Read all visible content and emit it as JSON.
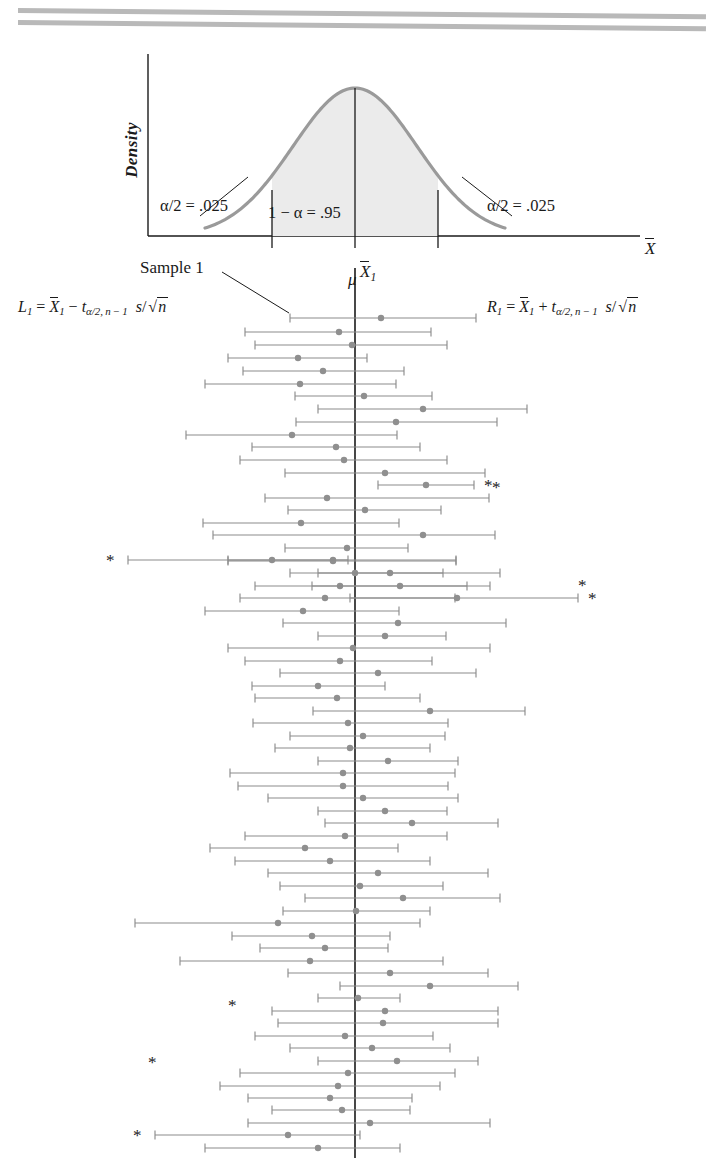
{
  "figure": {
    "top_rule_count": 2,
    "colors": {
      "curve": "#9a9a9a",
      "curve_fill": "#ebebeb",
      "interval_line": "#8c8c8c",
      "mean_dot": "#8f8f8f",
      "axis": "#1a1a1a",
      "mu_line": "#1a1a1a",
      "rule": "#b9b9b9"
    }
  },
  "density_panel": {
    "ylabel": "Density",
    "xlabel": "X̄",
    "center_label": "μ",
    "alpha_left_label": "α/2 = .025",
    "alpha_right_label": "α/2 = .025",
    "confidence_label": "1 − α = .95",
    "alpha_left_value": 0.025,
    "alpha_right_value": 0.025,
    "confidence_value": 0.95
  },
  "annotations": {
    "sample_label": "Sample 1",
    "xbar1_label": "X̄1",
    "formula_left": "L1 = X̄1 − tα/2, n−1 s/√n",
    "formula_right": "R1 = X̄1 + tα/2, n−1 s/√n",
    "miss_marker": "*"
  },
  "chart_data": {
    "type": "line",
    "xlabel": "X̄",
    "ylabel": "Sample",
    "mu": 355,
    "grid": false,
    "legend": null,
    "x_pixel_range": [
      18,
      700
    ],
    "note": "Each row is one sample's 95% CI: left endpoint L, sample mean (dot), right endpoint R, all in page x-pixels. covers=false rows are flagged with an asterisk.",
    "intervals": [
      {
        "y": 318,
        "left": 290,
        "mean": 381,
        "right": 476,
        "covers": true,
        "marker": null
      },
      {
        "y": 332,
        "left": 245,
        "mean": 339,
        "right": 431,
        "covers": true,
        "marker": null
      },
      {
        "y": 345,
        "left": 255,
        "mean": 352,
        "right": 447,
        "covers": true,
        "marker": null
      },
      {
        "y": 358,
        "left": 228,
        "mean": 298,
        "right": 367,
        "covers": true,
        "marker": null
      },
      {
        "y": 371,
        "left": 243,
        "mean": 323,
        "right": 404,
        "covers": true,
        "marker": null
      },
      {
        "y": 384,
        "left": 205,
        "mean": 300,
        "right": 396,
        "covers": true,
        "marker": null
      },
      {
        "y": 396,
        "left": 295,
        "mean": 364,
        "right": 432,
        "covers": true,
        "marker": null
      },
      {
        "y": 409,
        "left": 318,
        "mean": 423,
        "right": 527,
        "covers": true,
        "marker": null
      },
      {
        "y": 422,
        "left": 296,
        "mean": 396,
        "right": 497,
        "covers": true,
        "marker": null
      },
      {
        "y": 435,
        "left": 186,
        "mean": 292,
        "right": 397,
        "covers": true,
        "marker": null
      },
      {
        "y": 447,
        "left": 252,
        "mean": 336,
        "right": 420,
        "covers": true,
        "marker": null
      },
      {
        "y": 460,
        "left": 240,
        "mean": 344,
        "right": 447,
        "covers": true,
        "marker": null
      },
      {
        "y": 473,
        "left": 285,
        "mean": 385,
        "right": 485,
        "covers": true,
        "marker": null
      },
      {
        "y": 485,
        "left": 378,
        "mean": 426,
        "right": 474,
        "covers": false,
        "marker": "right"
      },
      {
        "y": 498,
        "left": 265,
        "mean": 327,
        "right": 489,
        "covers": true,
        "marker": null
      },
      {
        "y": 510,
        "left": 288,
        "mean": 365,
        "right": 441,
        "covers": true,
        "marker": null
      },
      {
        "y": 523,
        "left": 203,
        "mean": 301,
        "right": 399,
        "covers": true,
        "marker": null
      },
      {
        "y": 535,
        "left": 213,
        "mean": 423,
        "right": 495,
        "covers": true,
        "marker": null
      },
      {
        "y": 548,
        "left": 285,
        "mean": 347,
        "right": 408,
        "covers": true,
        "marker": null
      },
      {
        "y": 560,
        "left": 228,
        "mean": 333,
        "right": 456,
        "covers": true,
        "marker": null
      },
      {
        "y": 573,
        "left": 318,
        "mean": 355,
        "right": 443,
        "covers": true,
        "marker": null
      },
      {
        "y": 561,
        "left": 228,
        "mean": 333,
        "right": 456,
        "covers": true,
        "marker": null
      },
      {
        "y": 586,
        "left": 255,
        "mean": 340,
        "right": 467,
        "covers": true,
        "marker": null
      },
      {
        "y": 598,
        "left": 240,
        "mean": 325,
        "right": 455,
        "covers": true,
        "marker": null
      },
      {
        "y": 611,
        "left": 205,
        "mean": 303,
        "right": 399,
        "covers": true,
        "marker": null
      },
      {
        "y": 623,
        "left": 283,
        "mean": 398,
        "right": 506,
        "covers": true,
        "marker": null
      },
      {
        "y": 636,
        "left": 318,
        "mean": 385,
        "right": 446,
        "covers": true,
        "marker": null
      },
      {
        "y": 648,
        "left": 228,
        "mean": 353,
        "right": 490,
        "covers": true,
        "marker": null
      },
      {
        "y": 560,
        "left": 128,
        "mean": 272,
        "right": 348,
        "covers": false,
        "marker": "left"
      },
      {
        "y": 573,
        "left": 290,
        "mean": 390,
        "right": 500,
        "covers": true,
        "marker": null
      },
      {
        "y": 586,
        "left": 312,
        "mean": 400,
        "right": 490,
        "covers": true,
        "marker": null
      },
      {
        "y": 598,
        "left": 350,
        "mean": 457,
        "right": 578,
        "covers": false,
        "marker": "right"
      },
      {
        "y": 661,
        "left": 245,
        "mean": 340,
        "right": 432,
        "covers": true,
        "marker": null
      },
      {
        "y": 673,
        "left": 280,
        "mean": 378,
        "right": 476,
        "covers": true,
        "marker": null
      },
      {
        "y": 686,
        "left": 252,
        "mean": 318,
        "right": 385,
        "covers": true,
        "marker": null
      },
      {
        "y": 698,
        "left": 255,
        "mean": 337,
        "right": 420,
        "covers": true,
        "marker": null
      },
      {
        "y": 711,
        "left": 313,
        "mean": 430,
        "right": 525,
        "covers": true,
        "marker": null
      },
      {
        "y": 723,
        "left": 253,
        "mean": 348,
        "right": 448,
        "covers": true,
        "marker": null
      },
      {
        "y": 736,
        "left": 290,
        "mean": 363,
        "right": 445,
        "covers": true,
        "marker": null
      },
      {
        "y": 748,
        "left": 275,
        "mean": 350,
        "right": 430,
        "covers": true,
        "marker": null
      },
      {
        "y": 761,
        "left": 318,
        "mean": 388,
        "right": 458,
        "covers": true,
        "marker": null
      },
      {
        "y": 773,
        "left": 230,
        "mean": 343,
        "right": 455,
        "covers": true,
        "marker": null
      },
      {
        "y": 786,
        "left": 238,
        "mean": 343,
        "right": 448,
        "covers": true,
        "marker": null
      },
      {
        "y": 798,
        "left": 268,
        "mean": 363,
        "right": 458,
        "covers": true,
        "marker": null
      },
      {
        "y": 811,
        "left": 318,
        "mean": 385,
        "right": 447,
        "covers": true,
        "marker": null
      },
      {
        "y": 823,
        "left": 325,
        "mean": 412,
        "right": 498,
        "covers": true,
        "marker": null
      },
      {
        "y": 836,
        "left": 245,
        "mean": 345,
        "right": 447,
        "covers": true,
        "marker": null
      },
      {
        "y": 848,
        "left": 210,
        "mean": 305,
        "right": 398,
        "covers": true,
        "marker": null
      },
      {
        "y": 861,
        "left": 235,
        "mean": 330,
        "right": 430,
        "covers": true,
        "marker": null
      },
      {
        "y": 873,
        "left": 268,
        "mean": 378,
        "right": 488,
        "covers": true,
        "marker": null
      },
      {
        "y": 886,
        "left": 280,
        "mean": 360,
        "right": 443,
        "covers": true,
        "marker": null
      },
      {
        "y": 898,
        "left": 305,
        "mean": 403,
        "right": 500,
        "covers": true,
        "marker": null
      },
      {
        "y": 911,
        "left": 283,
        "mean": 356,
        "right": 430,
        "covers": true,
        "marker": null
      },
      {
        "y": 923,
        "left": 135,
        "mean": 278,
        "right": 420,
        "covers": true,
        "marker": null
      },
      {
        "y": 936,
        "left": 232,
        "mean": 312,
        "right": 390,
        "covers": true,
        "marker": null
      },
      {
        "y": 948,
        "left": 260,
        "mean": 325,
        "right": 388,
        "covers": true,
        "marker": null
      },
      {
        "y": 961,
        "left": 180,
        "mean": 310,
        "right": 443,
        "covers": true,
        "marker": null
      },
      {
        "y": 973,
        "left": 288,
        "mean": 390,
        "right": 488,
        "covers": true,
        "marker": null
      },
      {
        "y": 986,
        "left": 340,
        "mean": 430,
        "right": 518,
        "covers": true,
        "marker": null
      },
      {
        "y": 998,
        "left": 318,
        "mean": 358,
        "right": 400,
        "covers": true,
        "marker": null
      },
      {
        "y": 1011,
        "left": 272,
        "mean": 385,
        "right": 498,
        "covers": true,
        "marker": null
      },
      {
        "y": 1023,
        "left": 278,
        "mean": 383,
        "right": 498,
        "covers": true,
        "marker": null
      },
      {
        "y": 1036,
        "left": 255,
        "mean": 345,
        "right": 433,
        "covers": true,
        "marker": null
      },
      {
        "y": 1048,
        "left": 290,
        "mean": 372,
        "right": 450,
        "covers": true,
        "marker": null
      },
      {
        "y": 1061,
        "left": 318,
        "mean": 397,
        "right": 478,
        "covers": true,
        "marker": null
      },
      {
        "y": 1073,
        "left": 240,
        "mean": 348,
        "right": 455,
        "covers": true,
        "marker": null
      },
      {
        "y": 1086,
        "left": 220,
        "mean": 338,
        "right": 440,
        "covers": true,
        "marker": null
      },
      {
        "y": 1098,
        "left": 248,
        "mean": 330,
        "right": 412,
        "covers": true,
        "marker": null
      },
      {
        "y": 1110,
        "left": 272,
        "mean": 342,
        "right": 410,
        "covers": true,
        "marker": null
      },
      {
        "y": 1123,
        "left": 248,
        "mean": 370,
        "right": 490,
        "covers": true,
        "marker": null
      },
      {
        "y": 1135,
        "left": 155,
        "mean": 288,
        "right": 360,
        "covers": false,
        "marker": "left"
      },
      {
        "y": 1148,
        "left": 205,
        "mean": 318,
        "right": 400,
        "covers": true,
        "marker": null
      }
    ],
    "extra_markers": [
      {
        "y": 1005,
        "x": 228,
        "side": "left",
        "symbol": "*"
      },
      {
        "y": 1062,
        "x": 148,
        "side": "left",
        "symbol": "*"
      },
      {
        "y": 487,
        "x": 492,
        "side": "right",
        "symbol": "*"
      },
      {
        "y": 585,
        "x": 578,
        "side": "right",
        "symbol": "*"
      }
    ]
  }
}
